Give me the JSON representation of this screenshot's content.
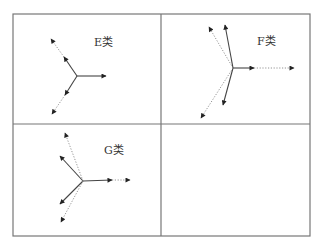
{
  "panels": [
    {
      "id": "E",
      "label": "E类",
      "label_pos": [
        94,
        33
      ],
      "center": [
        77,
        76
      ],
      "arrows": [
        {
          "to": [
            106,
            76
          ],
          "style": "solid"
        },
        {
          "to": [
            64,
            57
          ],
          "style": "solid"
        },
        {
          "from": [
            64,
            57
          ],
          "to": [
            51,
            39
          ],
          "style": "dotted"
        },
        {
          "to": [
            65,
            95
          ],
          "style": "solid"
        },
        {
          "from": [
            65,
            95
          ],
          "to": [
            52,
            114
          ],
          "style": "dotted"
        }
      ]
    },
    {
      "id": "F",
      "label": "F类",
      "label_pos": [
        257,
        32
      ],
      "center": [
        233,
        68
      ],
      "arrows": [
        {
          "to": [
            254,
            68
          ],
          "style": "solid"
        },
        {
          "from": [
            254,
            68
          ],
          "to": [
            294,
            68
          ],
          "style": "dotted"
        },
        {
          "to": [
            225,
            25
          ],
          "style": "solid"
        },
        {
          "to": [
            209,
            27
          ],
          "style": "dotted"
        },
        {
          "to": [
            223,
            105
          ],
          "style": "solid"
        },
        {
          "to": [
            201,
            118
          ],
          "style": "dotted"
        }
      ]
    },
    {
      "id": "G",
      "label": "G类",
      "label_pos": [
        104,
        141
      ],
      "center": [
        83,
        181
      ],
      "arrows": [
        {
          "to": [
            112,
            180
          ],
          "style": "solid"
        },
        {
          "from": [
            112,
            180
          ],
          "to": [
            130,
            180
          ],
          "style": "dotted"
        },
        {
          "to": [
            60,
            156
          ],
          "style": "solid"
        },
        {
          "to": [
            65,
            133
          ],
          "style": "dotted"
        },
        {
          "to": [
            60,
            204
          ],
          "style": "solid"
        },
        {
          "to": [
            61,
            222
          ],
          "style": "dotted"
        }
      ]
    },
    {
      "id": "empty",
      "label": "",
      "arrows": []
    }
  ],
  "frame": {
    "left": 13,
    "top": 14,
    "right": 310,
    "bottom": 236,
    "mid_x": 161,
    "mid_y": 124
  },
  "colors": {
    "frame": "#777777",
    "solid": "#444444",
    "dotted": "#888888",
    "arrowhead": "#222222"
  }
}
